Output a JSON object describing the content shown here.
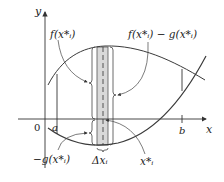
{
  "diagram": {
    "axes": {
      "x_label": "x",
      "y_label": "y",
      "origin_label": "0"
    },
    "ticks": {
      "a_label": "a",
      "b_label": "b"
    },
    "annotations": {
      "f_label": "f(x*ᵢ)",
      "f_minus_g_label": "f(x*ᵢ) − g(x*ᵢ)",
      "neg_g_label": "−g(x*ᵢ)",
      "delta_x_label": "Δxᵢ",
      "x_star_label": "x*ᵢ"
    },
    "colors": {
      "curve": "#3a3a3a",
      "strip_fill": "#d9d9d9",
      "axis": "#333333"
    }
  }
}
